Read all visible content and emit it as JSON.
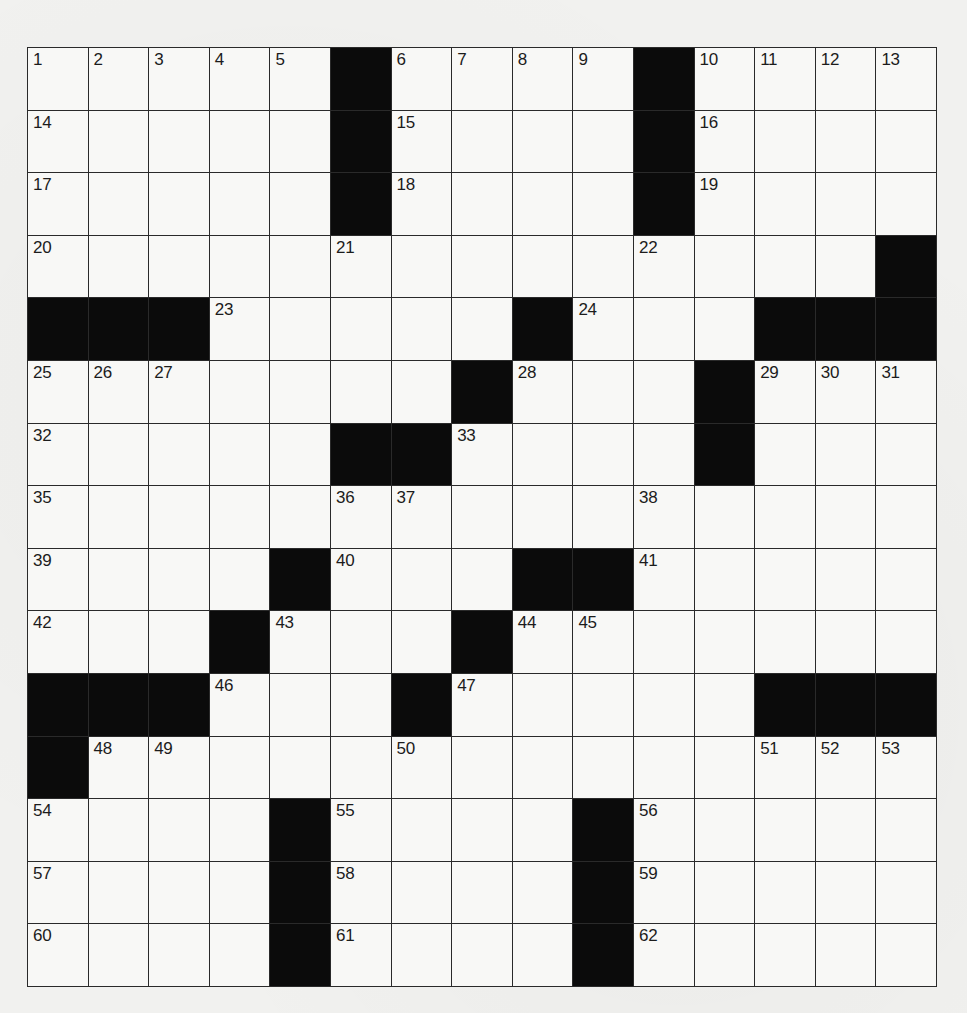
{
  "puzzle": {
    "rows": 15,
    "cols": 15,
    "colors": {
      "paper": "#f1f1ef",
      "cell": "#f8f8f6",
      "block": "#0b0b0b",
      "line": "#2a2a2a",
      "number": "#1c1c1c"
    },
    "layout": [
      ".....#....#....",
      ".....#....#....",
      ".....#....#....",
      "..............#",
      "###.....#...###",
      ".......#...#...",
      ".....##....#...",
      "...............",
      "....#...##.....",
      "...#...#.......",
      "###...#.....###",
      "#..............",
      "....#....#.....",
      "....#....#.....",
      "....#....#....."
    ],
    "numbers": [
      {
        "r": 0,
        "c": 0,
        "n": "1"
      },
      {
        "r": 0,
        "c": 1,
        "n": "2"
      },
      {
        "r": 0,
        "c": 2,
        "n": "3"
      },
      {
        "r": 0,
        "c": 3,
        "n": "4"
      },
      {
        "r": 0,
        "c": 4,
        "n": "5"
      },
      {
        "r": 0,
        "c": 6,
        "n": "6"
      },
      {
        "r": 0,
        "c": 7,
        "n": "7"
      },
      {
        "r": 0,
        "c": 8,
        "n": "8"
      },
      {
        "r": 0,
        "c": 9,
        "n": "9"
      },
      {
        "r": 0,
        "c": 11,
        "n": "10"
      },
      {
        "r": 0,
        "c": 12,
        "n": "11"
      },
      {
        "r": 0,
        "c": 13,
        "n": "12"
      },
      {
        "r": 0,
        "c": 14,
        "n": "13"
      },
      {
        "r": 1,
        "c": 0,
        "n": "14"
      },
      {
        "r": 1,
        "c": 6,
        "n": "15"
      },
      {
        "r": 1,
        "c": 11,
        "n": "16"
      },
      {
        "r": 2,
        "c": 0,
        "n": "17"
      },
      {
        "r": 2,
        "c": 6,
        "n": "18"
      },
      {
        "r": 2,
        "c": 11,
        "n": "19"
      },
      {
        "r": 3,
        "c": 0,
        "n": "20"
      },
      {
        "r": 3,
        "c": 5,
        "n": "21"
      },
      {
        "r": 3,
        "c": 10,
        "n": "22"
      },
      {
        "r": 4,
        "c": 3,
        "n": "23"
      },
      {
        "r": 4,
        "c": 9,
        "n": "24"
      },
      {
        "r": 5,
        "c": 0,
        "n": "25"
      },
      {
        "r": 5,
        "c": 1,
        "n": "26"
      },
      {
        "r": 5,
        "c": 2,
        "n": "27"
      },
      {
        "r": 5,
        "c": 8,
        "n": "28"
      },
      {
        "r": 5,
        "c": 12,
        "n": "29"
      },
      {
        "r": 5,
        "c": 13,
        "n": "30"
      },
      {
        "r": 5,
        "c": 14,
        "n": "31"
      },
      {
        "r": 6,
        "c": 0,
        "n": "32"
      },
      {
        "r": 6,
        "c": 7,
        "n": "33"
      },
      {
        "r": 6,
        "c": 11,
        "n": "34"
      },
      {
        "r": 7,
        "c": 0,
        "n": "35"
      },
      {
        "r": 7,
        "c": 5,
        "n": "36"
      },
      {
        "r": 7,
        "c": 6,
        "n": "37"
      },
      {
        "r": 7,
        "c": 10,
        "n": "38"
      },
      {
        "r": 8,
        "c": 0,
        "n": "39"
      },
      {
        "r": 8,
        "c": 5,
        "n": "40"
      },
      {
        "r": 8,
        "c": 10,
        "n": "41"
      },
      {
        "r": 9,
        "c": 0,
        "n": "42"
      },
      {
        "r": 9,
        "c": 4,
        "n": "43"
      },
      {
        "r": 9,
        "c": 8,
        "n": "44"
      },
      {
        "r": 9,
        "c": 9,
        "n": "45"
      },
      {
        "r": 10,
        "c": 3,
        "n": "46"
      },
      {
        "r": 10,
        "c": 7,
        "n": "47"
      },
      {
        "r": 11,
        "c": 1,
        "n": "48"
      },
      {
        "r": 11,
        "c": 2,
        "n": "49"
      },
      {
        "r": 11,
        "c": 6,
        "n": "50"
      },
      {
        "r": 11,
        "c": 12,
        "n": "51"
      },
      {
        "r": 11,
        "c": 13,
        "n": "52"
      },
      {
        "r": 11,
        "c": 14,
        "n": "53"
      },
      {
        "r": 12,
        "c": 0,
        "n": "54"
      },
      {
        "r": 12,
        "c": 5,
        "n": "55"
      },
      {
        "r": 12,
        "c": 10,
        "n": "56"
      },
      {
        "r": 13,
        "c": 0,
        "n": "57"
      },
      {
        "r": 13,
        "c": 5,
        "n": "58"
      },
      {
        "r": 13,
        "c": 10,
        "n": "59"
      },
      {
        "r": 14,
        "c": 0,
        "n": "60"
      },
      {
        "r": 14,
        "c": 5,
        "n": "61"
      },
      {
        "r": 14,
        "c": 10,
        "n": "62"
      }
    ],
    "entries": []
  }
}
